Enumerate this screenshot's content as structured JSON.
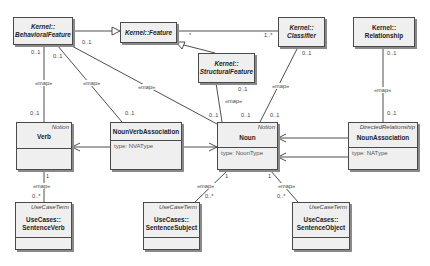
{
  "classes": {
    "behavioral_feature": {
      "line1": "Kernel::",
      "line2": "BehavioralFeature"
    },
    "feature": {
      "label": "Kernel::Feature"
    },
    "classifier": {
      "line1": "Kernel::",
      "line2": "Classifier"
    },
    "relationship": {
      "line1": "Kernel::",
      "line2": "Relationship"
    },
    "structural_feature": {
      "line1": "Kernel::",
      "line2": "StructuralFeature"
    },
    "verb": {
      "stereotype": "Notion",
      "name": "Verb"
    },
    "noun_verb_association": {
      "name": "NounVerbAssociation",
      "attribute": "type:  NVAType"
    },
    "noun": {
      "stereotype": "Notion",
      "name": "Noun",
      "attribute": "type:  NounType"
    },
    "noun_association": {
      "stereotype": "DirectedRelationship",
      "name": "NounAssociation",
      "attribute": "type:  NAType"
    },
    "sentence_verb": {
      "stereotype": "UseCaseTerm",
      "line1": "UseCases::",
      "line2": "SentenceVerb"
    },
    "sentence_subject": {
      "stereotype": "UseCaseTerm",
      "line1": "UseCases::",
      "line2": "SentenceSubject"
    },
    "sentence_object": {
      "stereotype": "UseCaseTerm",
      "line1": "UseCases::",
      "line2": "SentenceObject"
    }
  },
  "labels": {
    "map": "«map»",
    "m01": "0..1",
    "m1": "1",
    "m0n": "0..*",
    "mstar": "*",
    "m1n": "1..*"
  }
}
